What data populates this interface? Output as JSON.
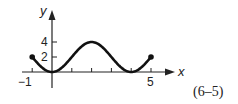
{
  "chart_data": {
    "type": "line",
    "title": "",
    "xlabel": "x",
    "ylabel": "y",
    "x_ticks": [
      -1,
      0,
      1,
      2,
      3,
      4,
      5
    ],
    "x_tick_labels": [
      "-1",
      "5"
    ],
    "y_ticks": [
      2,
      4
    ],
    "y_tick_labels": [
      "2",
      "4"
    ],
    "xlim": [
      -1,
      5
    ],
    "ylim": [
      0,
      4
    ],
    "grid": false,
    "series": [
      {
        "name": "y = 2 - 2cos(πx/2)",
        "x": [
          -1,
          -0.5,
          0,
          0.5,
          1,
          1.5,
          2,
          2.5,
          3,
          3.5,
          4,
          4.5,
          5
        ],
        "y": [
          2,
          0.59,
          0,
          0.59,
          2,
          3.41,
          4,
          3.41,
          2,
          0.59,
          0,
          0.59,
          2
        ],
        "endpoints": [
          [
            -1,
            2
          ],
          [
            5,
            2
          ]
        ],
        "endpoint_style": "closed-dot"
      }
    ],
    "annotation": "(6–5)"
  },
  "labels": {
    "y_axis": "y",
    "x_axis": "x",
    "y_tick_4": "4",
    "y_tick_2": "2",
    "x_tick_neg1": "−1",
    "x_tick_5": "5",
    "figure_ref": "(6–5)"
  }
}
